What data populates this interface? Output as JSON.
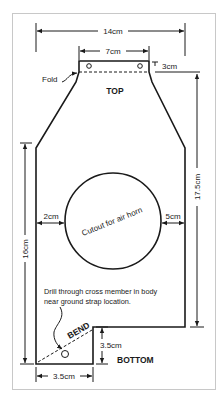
{
  "diagram": {
    "type": "bracket-template",
    "dimensions": {
      "overall_width": "14cm",
      "tab_width": "7cm",
      "fold_depth": "3cm",
      "right_height": "17.5cm",
      "left_height": "16cm",
      "left_margin": "2cm",
      "right_margin": "5cm",
      "bottom_step_height": "3.5cm",
      "bottom_width": "3.5cm"
    },
    "labels": {
      "fold": "Fold",
      "top": "TOP",
      "cutout": "Cutout for air horn",
      "note_line1": "Drill through cross member in body",
      "note_line2": "near ground strap location.",
      "bend": "BEND",
      "bottom": "BOTTOM"
    }
  }
}
